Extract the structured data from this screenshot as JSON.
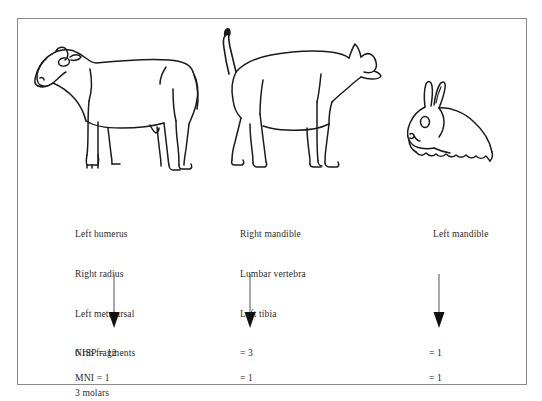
{
  "figure": {
    "background_color": "#ffffff",
    "border_color": "#8b8b8b",
    "ink_color": "#231f20"
  },
  "columns": [
    {
      "animal": "cow",
      "animal_icon": "cow-icon",
      "bone_list": [
        "Left humerus",
        "Right radius",
        "Left metatarsal",
        "6 rib fragments",
        "3 molars"
      ],
      "arrow_icon": "down-arrow-icon",
      "nisp_label": "NISP = 12",
      "mni_label": "MNI = 1"
    },
    {
      "animal": "dog",
      "animal_icon": "dog-icon",
      "bone_list": [
        "Right mandible",
        "Lumbar vertebra",
        "Left tibia"
      ],
      "arrow_icon": "down-arrow-icon",
      "nisp_label": "= 3",
      "mni_label": "= 1"
    },
    {
      "animal": "rabbit",
      "animal_icon": "rabbit-icon",
      "bone_list": [
        "Left mandible"
      ],
      "arrow_icon": "down-arrow-icon",
      "nisp_label": "= 1",
      "mni_label": "= 1"
    }
  ]
}
